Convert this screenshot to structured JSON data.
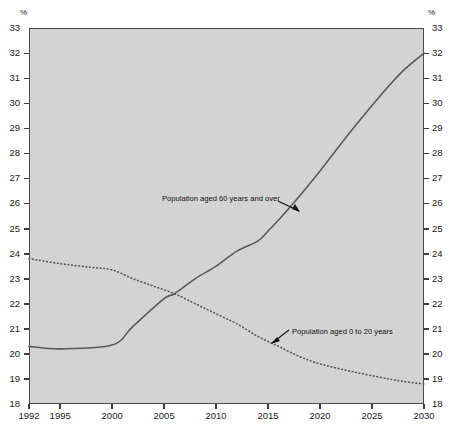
{
  "axis": {
    "unit_symbol": "%",
    "y_ticks": [
      "18",
      "19",
      "20",
      "21",
      "22",
      "23",
      "24",
      "25",
      "26",
      "27",
      "28",
      "29",
      "30",
      "31",
      "32",
      "33"
    ],
    "x_ticks": [
      "1992",
      "1995",
      "2000",
      "2005",
      "2010",
      "2015",
      "2020",
      "2025",
      "2030"
    ]
  },
  "annotations": {
    "older": "Population aged 60 years and over",
    "younger": "Population aged 0 to 20 years"
  },
  "colors": {
    "plot_background": "#d3d3d3",
    "page_background": "#ffffff",
    "line": "#5a5a5a",
    "axis": "#3c3c3c",
    "text": "#1a1a1a"
  },
  "chart_data": {
    "type": "line",
    "title": "",
    "subtitle": "",
    "xlabel": "",
    "ylabel": "%",
    "xlim": [
      1992,
      2030
    ],
    "ylim": [
      18,
      33
    ],
    "y_tick_step": 1,
    "grid": false,
    "legend_position": "inline-annotations",
    "x_tick_values": [
      1992,
      1995,
      2000,
      2005,
      2010,
      2015,
      2020,
      2025,
      2030
    ],
    "series": [
      {
        "name": "Population aged 60 years and over",
        "style": "solid",
        "x": [
          1992,
          1995,
          2000,
          2002,
          2005,
          2006,
          2008,
          2010,
          2012,
          2014,
          2015,
          2017,
          2020,
          2023,
          2026,
          2028,
          2030
        ],
        "values": [
          20.3,
          20.2,
          20.35,
          21.1,
          22.2,
          22.4,
          23.0,
          23.5,
          24.1,
          24.5,
          24.9,
          25.8,
          27.3,
          28.9,
          30.4,
          31.3,
          32.0
        ]
      },
      {
        "name": "Population aged 0 to 20 years",
        "style": "dotted",
        "x": [
          1992,
          1995,
          1998,
          2000,
          2002,
          2004,
          2006,
          2008,
          2010,
          2012,
          2014,
          2016,
          2018,
          2020,
          2023,
          2026,
          2028,
          2030
        ],
        "values": [
          23.8,
          23.6,
          23.45,
          23.35,
          23.0,
          22.7,
          22.4,
          22.0,
          21.6,
          21.2,
          20.7,
          20.3,
          19.9,
          19.6,
          19.3,
          19.05,
          18.9,
          18.8
        ]
      }
    ],
    "crossover": {
      "x": 2006,
      "y": 22.4
    }
  }
}
